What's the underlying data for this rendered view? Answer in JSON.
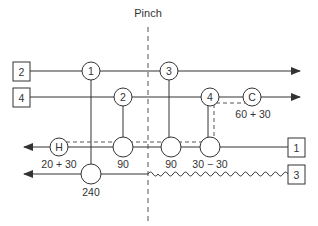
{
  "pinch": {
    "label": "Pinch",
    "x": 148
  },
  "colors": {
    "line": "#333333",
    "dashed": "#555555",
    "fill": "#ffffff"
  },
  "streams": [
    {
      "id": "2",
      "label": "2",
      "direction": "right",
      "type": "hot",
      "y": 71
    },
    {
      "id": "4",
      "label": "4",
      "direction": "right",
      "type": "hot",
      "y": 97
    },
    {
      "id": "1",
      "label": "1",
      "direction": "left",
      "type": "cold",
      "y": 147
    },
    {
      "id": "3",
      "label": "3",
      "direction": "left",
      "type": "cold",
      "y": 174,
      "note": "wavy segment above pinch"
    }
  ],
  "exchangers": [
    {
      "id": "1",
      "label": "1",
      "x": 91,
      "hot_stream": "2",
      "cold_stream": "3"
    },
    {
      "id": "2",
      "label": "2",
      "x": 123,
      "hot_stream": "4",
      "cold_stream": "1"
    },
    {
      "id": "3",
      "label": "3",
      "x": 169,
      "hot_stream": "2",
      "cold_stream": "1"
    },
    {
      "id": "4",
      "label": "4",
      "x": 210,
      "hot_stream": "4",
      "cold_stream": "1"
    }
  ],
  "utilities": [
    {
      "id": "C",
      "label": "C",
      "type": "cooler",
      "stream": "4",
      "duty": "60 + 30"
    },
    {
      "id": "H",
      "label": "H",
      "type": "heater",
      "stream": "1",
      "duty": "20 + 30"
    }
  ],
  "duties": {
    "ex1_cold": "240",
    "ex2_cold": "90",
    "ex3_cold": "90",
    "ex4_cold": "30 − 30",
    "heater": "20 + 30",
    "cooler": "60 + 30"
  }
}
